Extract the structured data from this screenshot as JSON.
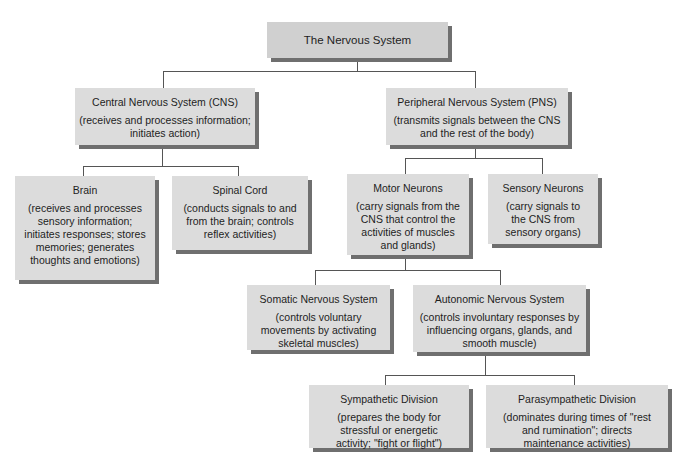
{
  "diagram": {
    "root": {
      "title": "The Nervous System"
    },
    "cns": {
      "title": "Central Nervous System (CNS)",
      "desc": "(receives and processes information; initiates action)"
    },
    "pns": {
      "title": "Peripheral Nervous System (PNS)",
      "desc": "(transmits signals between the CNS and the rest of the body)"
    },
    "brain": {
      "title": "Brain",
      "desc": "(receives and processes sensory information; initiates responses; stores memories; generates thoughts and emotions)"
    },
    "spinal_cord": {
      "title": "Spinal Cord",
      "desc": "(conducts signals to and from the brain; controls reflex activities)"
    },
    "motor_neurons": {
      "title": "Motor Neurons",
      "desc": "(carry signals from the CNS that control the activities of muscles and glands)"
    },
    "sensory_neurons": {
      "title": "Sensory Neurons",
      "desc": "(carry signals to the CNS from sensory organs)"
    },
    "somatic": {
      "title": "Somatic Nervous System",
      "desc": "(controls voluntary movements by activating skeletal muscles)"
    },
    "autonomic": {
      "title": "Autonomic Nervous System",
      "desc": "(controls involuntary responses by influencing organs, glands, and smooth muscle)"
    },
    "sympathetic": {
      "title": "Sympathetic Division",
      "desc": "(prepares the body for stressful or energetic activity; \"fight or flight\")"
    },
    "parasympathetic": {
      "title": "Parasympathetic Division",
      "desc": "(dominates during times of \"rest and rumination\"; directs maintenance activities)"
    }
  },
  "colors": {
    "box_fill": "#dcdcdc",
    "box_shadow": "#6f6f6f",
    "connector": "#555555"
  }
}
